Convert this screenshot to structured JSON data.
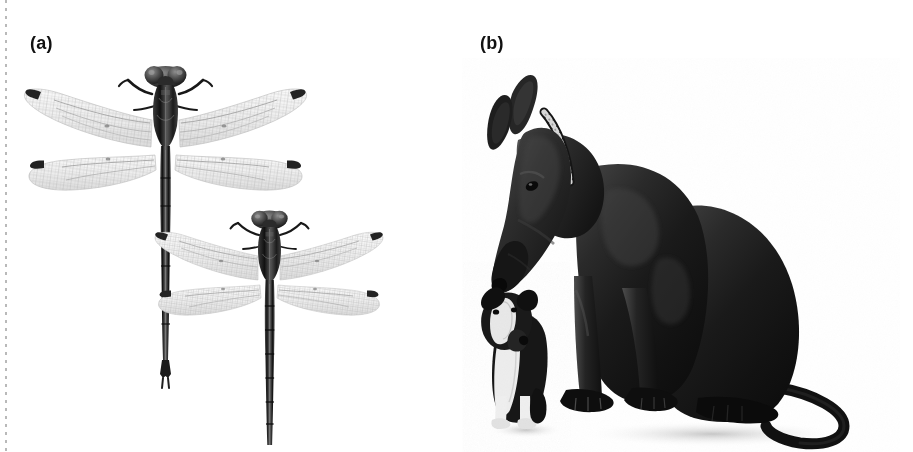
{
  "figure": {
    "background_color": "#ffffff",
    "width": 913,
    "height": 452,
    "type": "two-panel scientific photographic figure",
    "trim_line": {
      "present": true,
      "style": "dotted",
      "color": "#b9b9b9",
      "edge": "left"
    }
  },
  "panels": [
    {
      "id": "a",
      "label": "(a)",
      "label_position": {
        "x": 30,
        "y": 34
      },
      "content": "photograph of two dragonflies (Odonata) of contrasting body size, dorsal view on white background",
      "subjects": [
        {
          "name": "large-dragonfly",
          "role": "larger specimen",
          "orientation": "head up, dorsal view",
          "features": [
            "broad hyaline wings",
            "dark pterostigma at each wingtip",
            "long slender abdomen",
            "large compound eyes",
            "raised forelegs"
          ]
        },
        {
          "name": "small-dragonfly",
          "role": "smaller specimen",
          "orientation": "head up, dorsal view",
          "features": [
            "broad hyaline wings",
            "dark pterostigma at each wingtip",
            "banded abdomen",
            "large compound eyes",
            "raised forelegs"
          ]
        }
      ]
    },
    {
      "id": "b",
      "label": "(b)",
      "label_position": {
        "x": 480,
        "y": 34
      },
      "content": "photograph of a large dark Great Dane sitting beside a very small black-and-white dog, on white background",
      "subjects": [
        {
          "name": "great-dane",
          "role": "large dog",
          "pose": "sitting, head lowered looking down toward the small dog",
          "features": [
            "cropped upright ears",
            "metal chain collar",
            "long tail curving on ground",
            "dark short coat"
          ]
        },
        {
          "name": "small-dog",
          "role": "small dog",
          "pose": "standing, head tilted upward looking at the large dog",
          "features": [
            "black and white coat",
            "white chest blaze",
            "white paws",
            "folded ears"
          ]
        }
      ]
    }
  ],
  "colors": {
    "background": "#ffffff",
    "label_text": "#111111",
    "trim_dots": "#b9b9b9",
    "dog_dark": "#1b1b1b",
    "dog_mid": "#4a4a4a",
    "dog_light": "#9b9b9b",
    "wing_membrane": "#efefef",
    "wing_vein": "#b0b0b0",
    "insect_body_dark": "#2a2a2a"
  }
}
